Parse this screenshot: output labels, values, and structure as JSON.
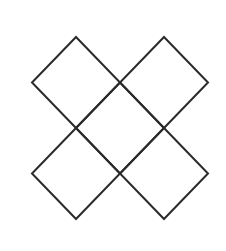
{
  "diagram": {
    "background_color": "#ffffff",
    "stroke_color": "#2a2a2a",
    "stroke_width": 2,
    "half_width": 44,
    "half_height": 45.5,
    "shapes": [
      {
        "name": "diamond-top-left",
        "cx": 76,
        "cy": 82.5
      },
      {
        "name": "diamond-top-right",
        "cx": 164,
        "cy": 82.5
      },
      {
        "name": "diamond-center",
        "cx": 120,
        "cy": 128
      },
      {
        "name": "diamond-bottom-left",
        "cx": 76,
        "cy": 173.5
      },
      {
        "name": "diamond-bottom-right",
        "cx": 164,
        "cy": 173.5
      }
    ]
  }
}
